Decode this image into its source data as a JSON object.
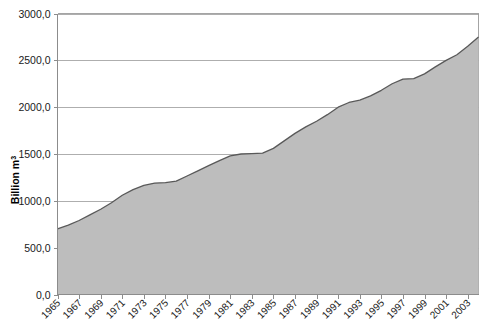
{
  "chart_data": {
    "type": "area",
    "title": "",
    "xlabel": "",
    "ylabel": "Billion m",
    "ylabel_superscript": "3",
    "ylim": [
      0,
      3000
    ],
    "ytick_labels": [
      "3000,0",
      "2500,0",
      "2000,0",
      "1500,0",
      "1000,0",
      "500,0",
      "0,0"
    ],
    "ytick_values": [
      3000,
      2500,
      2000,
      1500,
      1000,
      500,
      0
    ],
    "grid": true,
    "legend": "none",
    "decimal_separator": ",",
    "xtick_labels": [
      "1965",
      "1967",
      "1969",
      "1971",
      "1973",
      "1975",
      "1977",
      "1979",
      "1981",
      "1983",
      "1985",
      "1987",
      "1989",
      "1991",
      "1993",
      "1995",
      "1997",
      "1999",
      "2001",
      "2003"
    ],
    "x": [
      1965,
      1966,
      1967,
      1968,
      1969,
      1970,
      1971,
      1972,
      1973,
      1974,
      1975,
      1976,
      1977,
      1978,
      1979,
      1980,
      1981,
      1982,
      1983,
      1984,
      1985,
      1986,
      1987,
      1988,
      1989,
      1990,
      1991,
      1992,
      1993,
      1994,
      1995,
      1996,
      1997,
      1998,
      1999,
      2000,
      2001,
      2002,
      2003,
      2004
    ],
    "values": [
      700,
      740,
      790,
      850,
      910,
      980,
      1060,
      1120,
      1165,
      1190,
      1195,
      1210,
      1265,
      1320,
      1375,
      1430,
      1480,
      1500,
      1505,
      1510,
      1560,
      1640,
      1720,
      1790,
      1850,
      1920,
      2000,
      2050,
      2075,
      2120,
      2180,
      2250,
      2300,
      2305,
      2355,
      2430,
      2500,
      2560,
      2650,
      2750
    ],
    "series_name": "Natural gas production",
    "colors": {
      "area_fill": "#bdbdbd",
      "area_outline": "#595959",
      "gridline": "#9a9a9a",
      "axis": "#8c8c8c",
      "text": "#1a1a1a",
      "background": "#ffffff"
    }
  }
}
